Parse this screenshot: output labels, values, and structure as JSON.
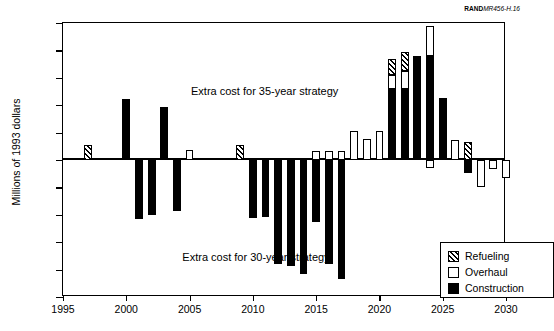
{
  "credit": {
    "bold": "RAND",
    "italic": "MR456-H.16"
  },
  "legend": {
    "items": [
      {
        "label": "Refueling",
        "key": "refueling",
        "swatch": "hatched-swatch"
      },
      {
        "label": "Overhaul",
        "key": "overhaul",
        "swatch": "white-swatch"
      },
      {
        "label": "Construction",
        "key": "construction",
        "swatch": "black-swatch"
      }
    ]
  },
  "annotations": [
    {
      "id": "annot35",
      "text": "Extra cost for 35-year strategy"
    },
    {
      "id": "annot30",
      "text": "Extra cost for 30-year strategy"
    }
  ],
  "chart_data": {
    "type": "bar",
    "title": "",
    "xlabel": "",
    "ylabel": "Millions of 1993 dollars",
    "ylim": [
      -2500,
      2500
    ],
    "xlim": [
      1995,
      2030
    ],
    "yticks": [
      2500,
      2000,
      1500,
      1000,
      500,
      0,
      -500,
      -1000,
      -1500,
      -2000,
      -2500
    ],
    "ytick_labels": [
      "2500",
      "2000",
      "1500",
      "1000",
      "500",
      "0",
      "-500",
      "-1000",
      "-1500",
      "-2000",
      "-2500"
    ],
    "xticks": [
      1995,
      2000,
      2005,
      2010,
      2015,
      2020,
      2025,
      2030
    ],
    "xtick_labels": [
      "1995",
      "2000",
      "2005",
      "2010",
      "2015",
      "2020",
      "2025",
      "2030"
    ],
    "grid": false,
    "legend_position": "lower-right",
    "stacked": true,
    "bar_width_years": 0.62,
    "series": [
      {
        "name": "Refueling",
        "key": "refueling",
        "values": [
          0,
          0,
          280,
          0,
          0,
          0,
          0,
          0,
          0,
          0,
          0,
          0,
          0,
          0,
          270,
          0,
          0,
          0,
          0,
          0,
          0,
          0,
          0,
          0,
          0,
          0,
          300,
          340,
          0,
          0,
          0,
          330,
          0,
          0,
          0,
          0
        ]
      },
      {
        "name": "Overhaul",
        "key": "overhaul",
        "values": [
          0,
          0,
          0,
          0,
          0,
          0,
          0,
          0,
          0,
          0,
          180,
          0,
          0,
          0,
          0,
          0,
          0,
          0,
          0,
          0,
          170,
          170,
          170,
          530,
          380,
          530,
          250,
          330,
          0,
          540,
          0,
          370,
          0,
          0,
          0,
          0
        ]
      },
      {
        "name": "Construction",
        "key": "construction",
        "values": [
          0,
          0,
          0,
          0,
          0,
          1120,
          -1080,
          -1000,
          970,
          -930,
          0,
          0,
          0,
          0,
          0,
          -1050,
          -1040,
          -1900,
          -1930,
          -2080,
          -1130,
          -1900,
          -2180,
          0,
          0,
          0,
          1300,
          1300,
          1900,
          1900,
          1130,
          -230,
          -130,
          -300,
          -450,
          0
        ]
      }
    ],
    "categories": [
      1995,
      1996,
      1997,
      1998,
      1999,
      2000,
      2001,
      2002,
      2003,
      2004,
      2005,
      2006,
      2007,
      2008,
      2009,
      2010,
      2011,
      2012,
      2013,
      2014,
      2015,
      2016,
      2017,
      2018,
      2019,
      2020,
      2021,
      2022,
      2023,
      2024,
      2025,
      2026,
      2027,
      2028,
      2029,
      2030
    ],
    "bars": [
      {
        "year": 1997,
        "segments": [
          {
            "type": "refueling",
            "from": 0,
            "to": 280
          }
        ]
      },
      {
        "year": 2000,
        "segments": [
          {
            "type": "construction",
            "from": 0,
            "to": 1120
          }
        ]
      },
      {
        "year": 2001,
        "segments": [
          {
            "type": "construction",
            "from": 0,
            "to": -1080
          }
        ]
      },
      {
        "year": 2002,
        "segments": [
          {
            "type": "construction",
            "from": 0,
            "to": -1000
          }
        ]
      },
      {
        "year": 2003,
        "segments": [
          {
            "type": "construction",
            "from": 0,
            "to": 970
          }
        ]
      },
      {
        "year": 2004,
        "segments": [
          {
            "type": "construction",
            "from": 0,
            "to": -930
          }
        ]
      },
      {
        "year": 2005,
        "segments": [
          {
            "type": "overhaul",
            "from": 0,
            "to": 180
          }
        ]
      },
      {
        "year": 2009,
        "segments": [
          {
            "type": "refueling",
            "from": 0,
            "to": 270
          }
        ]
      },
      {
        "year": 2010,
        "segments": [
          {
            "type": "construction",
            "from": 0,
            "to": -1050
          }
        ]
      },
      {
        "year": 2011,
        "segments": [
          {
            "type": "construction",
            "from": 0,
            "to": -1040
          }
        ]
      },
      {
        "year": 2012,
        "segments": [
          {
            "type": "construction",
            "from": 0,
            "to": -1900
          }
        ]
      },
      {
        "year": 2013,
        "segments": [
          {
            "type": "construction",
            "from": 0,
            "to": -1930
          }
        ]
      },
      {
        "year": 2014,
        "segments": [
          {
            "type": "construction",
            "from": 0,
            "to": -2080
          }
        ]
      },
      {
        "year": 2015,
        "segments": [
          {
            "type": "overhaul",
            "from": 0,
            "to": 170
          },
          {
            "type": "construction",
            "from": 0,
            "to": -1130
          }
        ]
      },
      {
        "year": 2016,
        "segments": [
          {
            "type": "overhaul",
            "from": 0,
            "to": 170
          },
          {
            "type": "construction",
            "from": 0,
            "to": -1900
          }
        ]
      },
      {
        "year": 2017,
        "segments": [
          {
            "type": "overhaul",
            "from": 0,
            "to": 170
          },
          {
            "type": "construction",
            "from": 0,
            "to": -2180
          }
        ]
      },
      {
        "year": 2018,
        "segments": [
          {
            "type": "overhaul",
            "from": 0,
            "to": 530
          }
        ]
      },
      {
        "year": 2019,
        "segments": [
          {
            "type": "overhaul",
            "from": 0,
            "to": 380
          }
        ]
      },
      {
        "year": 2020,
        "segments": [
          {
            "type": "overhaul",
            "from": 0,
            "to": 530
          }
        ]
      },
      {
        "year": 2021,
        "segments": [
          {
            "type": "construction",
            "from": 0,
            "to": 1300
          },
          {
            "type": "overhaul",
            "from": 1300,
            "to": 1550
          },
          {
            "type": "refueling",
            "from": 1550,
            "to": 1850
          }
        ]
      },
      {
        "year": 2022,
        "segments": [
          {
            "type": "construction",
            "from": 0,
            "to": 1300
          },
          {
            "type": "overhaul",
            "from": 1300,
            "to": 1630
          },
          {
            "type": "refueling",
            "from": 1630,
            "to": 1970
          }
        ]
      },
      {
        "year": 2023,
        "segments": [
          {
            "type": "construction",
            "from": 0,
            "to": 1900
          }
        ]
      },
      {
        "year": 2024,
        "segments": [
          {
            "type": "construction",
            "from": 0,
            "to": 1900
          },
          {
            "type": "overhaul",
            "from": 1900,
            "to": 2440
          },
          {
            "type": "overhaul",
            "from": 0,
            "to": -150
          }
        ]
      },
      {
        "year": 2025,
        "segments": [
          {
            "type": "construction",
            "from": 0,
            "to": 1130
          }
        ]
      },
      {
        "year": 2026,
        "segments": [
          {
            "type": "overhaul",
            "from": 0,
            "to": 370
          }
        ]
      },
      {
        "year": 2027,
        "segments": [
          {
            "type": "refueling",
            "from": 0,
            "to": 330
          },
          {
            "type": "construction",
            "from": 0,
            "to": -230
          }
        ]
      },
      {
        "year": 2028,
        "segments": [
          {
            "type": "overhaul",
            "from": 0,
            "to": -500
          }
        ]
      },
      {
        "year": 2029,
        "segments": [
          {
            "type": "overhaul",
            "from": 0,
            "to": -170
          }
        ]
      },
      {
        "year": 2030,
        "segments": [
          {
            "type": "overhaul",
            "from": 0,
            "to": -330
          }
        ]
      }
    ],
    "extra_bars_note": ""
  }
}
